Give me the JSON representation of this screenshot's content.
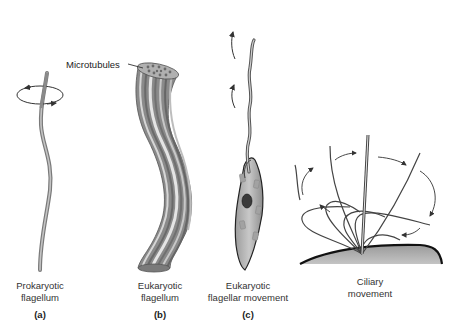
{
  "figure": {
    "callout": "Microtubules",
    "panels": [
      {
        "letter": "(a)",
        "caption_line1": "Prokaryotic",
        "caption_line2": "flagellum"
      },
      {
        "letter": "(b)",
        "caption_line1": "Eukaryotic",
        "caption_line2": "flagellum"
      },
      {
        "letter": "(c)",
        "caption_line1": "Eukaryotic",
        "caption_line2": "flagellar movement"
      },
      {
        "letter": "",
        "caption_line1": "Ciliary",
        "caption_line2": "movement"
      }
    ],
    "colors": {
      "flagellum_gray": "#9a9a9a",
      "stripe_dark": "#6e6e6e",
      "stripe_light": "#d8d8d8",
      "cell_body": "#b8b8b8",
      "nucleus": "#3a3a3a",
      "surface": "#a8a8a8",
      "arrow": "#333333"
    }
  }
}
